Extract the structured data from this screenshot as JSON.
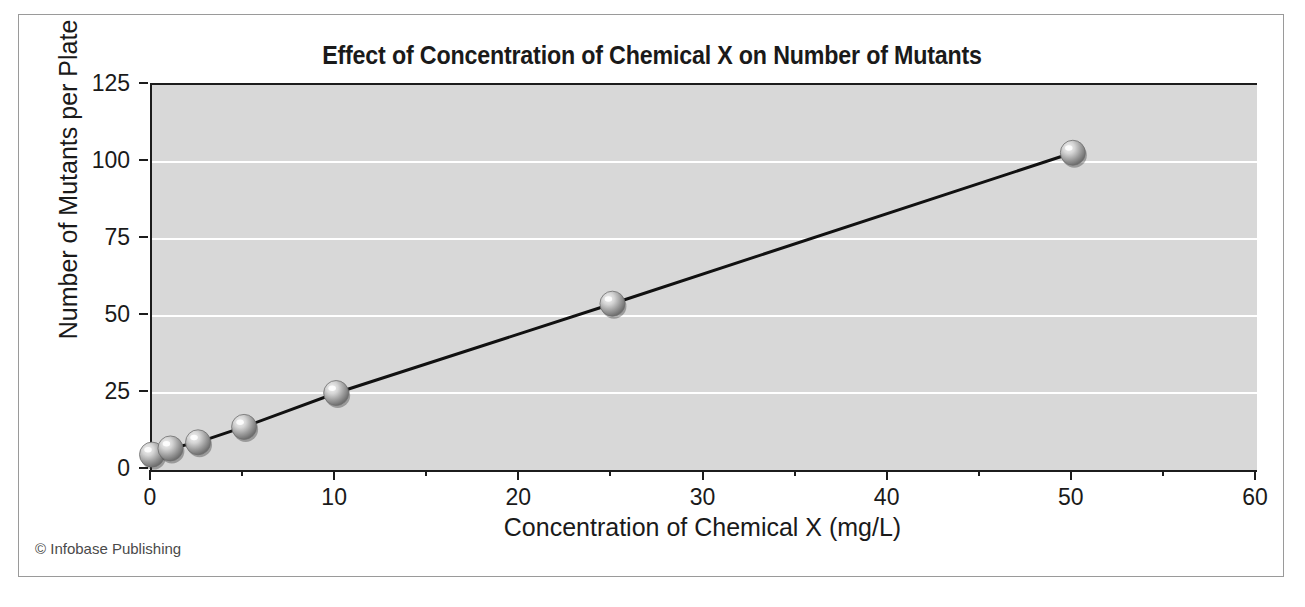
{
  "chart_data": {
    "type": "line",
    "title": "Effect of Concentration of Chemical X on Number of Mutants",
    "xlabel": "Concentration of Chemical X (mg/L)",
    "ylabel": "Number of Mutants per Plate",
    "xlim": [
      0,
      60
    ],
    "ylim": [
      0,
      125
    ],
    "grid": true,
    "legend": "none",
    "x_ticks": [
      0,
      10,
      20,
      30,
      40,
      50,
      60
    ],
    "x_minor_ticks": [
      5,
      15,
      25,
      35,
      45,
      55
    ],
    "y_ticks": [
      0,
      25,
      50,
      75,
      100,
      125
    ],
    "marker_style": "3d-sphere",
    "series": [
      {
        "name": "Mutants per plate",
        "points": [
          {
            "x": 0,
            "y": 5
          },
          {
            "x": 1,
            "y": 7
          },
          {
            "x": 2.5,
            "y": 9
          },
          {
            "x": 5,
            "y": 14
          },
          {
            "x": 10,
            "y": 25
          },
          {
            "x": 25,
            "y": 54
          },
          {
            "x": 50,
            "y": 103
          }
        ]
      }
    ]
  },
  "footer": {
    "copyright": "© Infobase Publishing"
  },
  "colors": {
    "plot_background": "#d8d8d8",
    "page_background": "#ffffff",
    "gridline": "#ffffff",
    "axis": "#1c1c1c",
    "line": "#111111",
    "frame_border": "#9a9a9a",
    "text": "#1a1a1a"
  }
}
